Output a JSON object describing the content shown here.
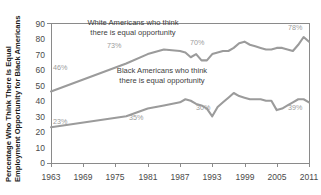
{
  "chart_data": {
    "type": "line",
    "title": "",
    "xlabel": "",
    "ylabel": "Percentage Who Think There Is Equal Employment Opportunity for Black Americans",
    "ylim": [
      0,
      90
    ],
    "xlim": [
      1963,
      2011
    ],
    "y_ticks": [
      "0",
      "10",
      "20",
      "30",
      "40",
      "50",
      "60",
      "70",
      "80",
      "90"
    ],
    "x_ticks": [
      "1963",
      "1969",
      "1975",
      "1981",
      "1987",
      "1993",
      "1999",
      "2005",
      "2011"
    ],
    "grid": false,
    "legend_position": "inline-annotations",
    "series": [
      {
        "name": "White Americans who think there is equal opportunity",
        "annotation_line1": "White Americans who think",
        "annotation_line2": "there is equal opportunity",
        "color": "#9b9b9b",
        "x": [
          1963,
          1977,
          1981,
          1984,
          1987,
          1988,
          1989,
          1990,
          1991,
          1992,
          1993,
          1994,
          1995,
          1996,
          1997,
          1998,
          1999,
          2000,
          2001,
          2002,
          2003,
          2004,
          2005,
          2006,
          2007,
          2008,
          2009,
          2010,
          2011
        ],
        "values": [
          46,
          64,
          70,
          73,
          72,
          71,
          68,
          70,
          66,
          66,
          70,
          71,
          72,
          72,
          74,
          77,
          78,
          76,
          75,
          74,
          73,
          73,
          74,
          74,
          73,
          72,
          76,
          81,
          78
        ],
        "point_labels": [
          {
            "x": 1963,
            "value": 46,
            "text": "46%"
          },
          {
            "x": 1984,
            "value": 73,
            "text": "73%"
          },
          {
            "x": 1993,
            "value": 70,
            "text": "70%"
          },
          {
            "x": 2010,
            "value": 81,
            "text": "78%"
          }
        ]
      },
      {
        "name": "Black Americans who think there is equal opportunity",
        "annotation_line1": "Black Americans who think",
        "annotation_line2": "there is equal opportunity",
        "color": "#9b9b9b",
        "x": [
          1963,
          1977,
          1981,
          1984,
          1987,
          1988,
          1989,
          1990,
          1991,
          1992,
          1993,
          1994,
          1995,
          1996,
          1997,
          1998,
          1999,
          2000,
          2001,
          2002,
          2003,
          2004,
          2005,
          2006,
          2007,
          2008,
          2009,
          2010,
          2011
        ],
        "values": [
          23,
          30,
          35,
          37,
          39,
          41,
          40,
          38,
          37,
          35,
          30,
          36,
          39,
          42,
          45,
          43,
          42,
          41,
          41,
          41,
          40,
          40,
          34,
          35,
          37,
          39,
          41,
          41,
          39
        ],
        "point_labels": [
          {
            "x": 1963,
            "value": 23,
            "text": "23%"
          },
          {
            "x": 1984,
            "value": 37,
            "text": "35%"
          },
          {
            "x": 1993,
            "value": 30,
            "text": "30%"
          },
          {
            "x": 2011,
            "value": 39,
            "text": "39%"
          }
        ]
      }
    ]
  },
  "axis": {
    "y_title": "Percentage Who Think There Is Equal Employment Opportunity for Black Americans",
    "y_title_line1": "Percentage Who Think There Is Equal",
    "y_title_line2": "Employment Opportunity for Black Americans"
  },
  "y_ticks": {
    "t0": "0",
    "t1": "10",
    "t2": "20",
    "t3": "30",
    "t4": "40",
    "t5": "50",
    "t6": "60",
    "t7": "70",
    "t8": "80",
    "t9": "90"
  },
  "x_ticks": {
    "t0": "1963",
    "t1": "1969",
    "t2": "1975",
    "t3": "1981",
    "t4": "1987",
    "t5": "1993",
    "t6": "1999",
    "t7": "2005",
    "t8": "2011"
  },
  "annotations": {
    "white_l1": "White Americans who think",
    "white_l2": "there is equal opportunity",
    "black_l1": "Black Americans who think",
    "black_l2": "there is equal opportunity"
  },
  "point_labels": {
    "white_start": "46%",
    "white_1984": "73%",
    "white_1993": "70%",
    "white_end": "78%",
    "black_start": "23%",
    "black_1984": "35%",
    "black_1993": "30%",
    "black_end": "39%"
  },
  "colors": {
    "line": "#9b9b9b",
    "axis": "#8a8a8a",
    "text": "#3d3d3d",
    "label": "#9b9b9b"
  }
}
